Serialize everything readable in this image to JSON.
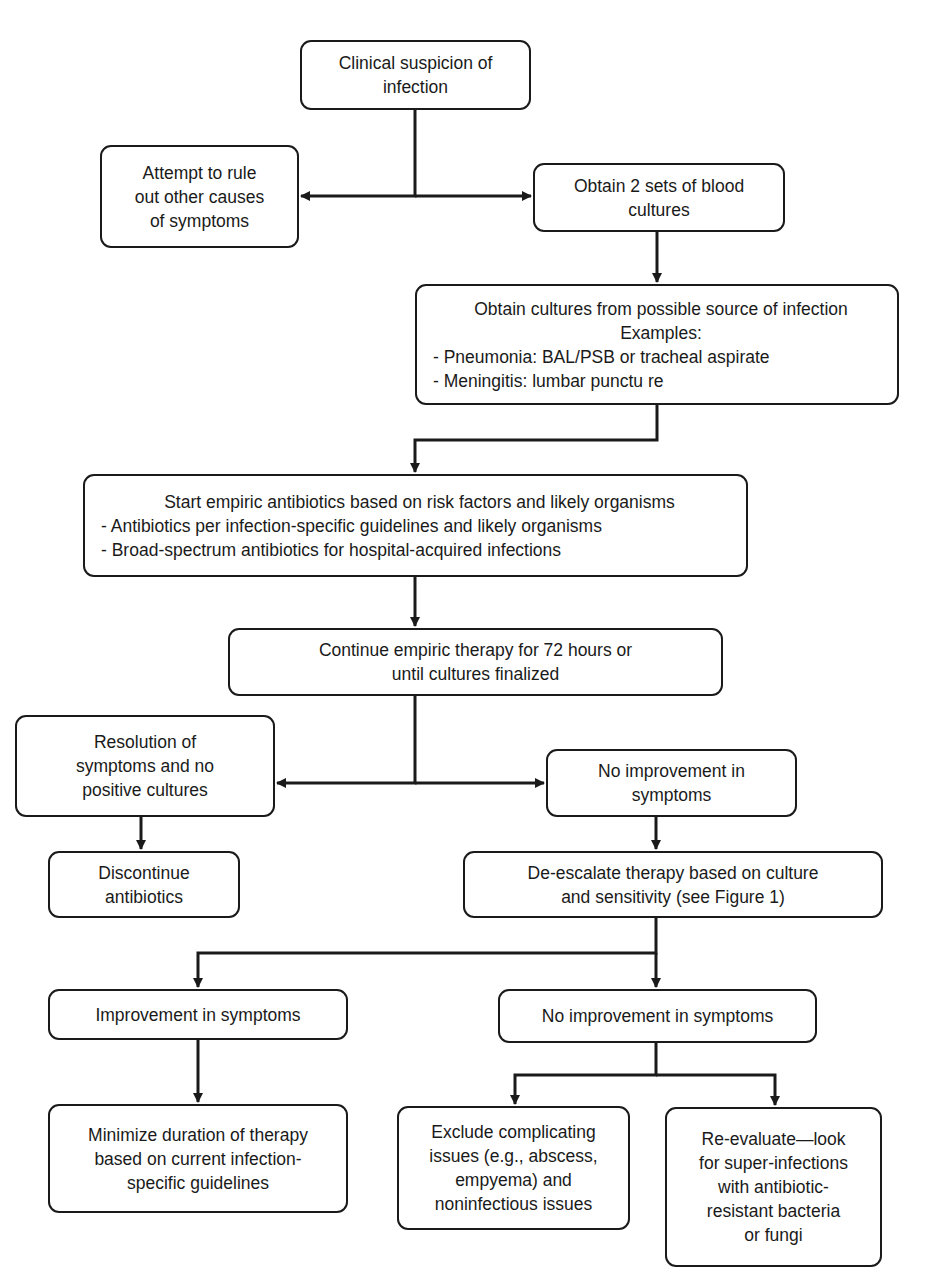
{
  "diagram": {
    "type": "flowchart",
    "nodes": {
      "clinical_suspicion": {
        "lines": [
          "Clinical suspicion of",
          "infection"
        ]
      },
      "rule_out_other": {
        "lines": [
          "Attempt to rule",
          "out other causes",
          "of symptoms"
        ]
      },
      "blood_cultures": {
        "lines": [
          "Obtain 2 sets of blood",
          "cultures"
        ]
      },
      "source_cultures": {
        "lines": [
          "Obtain cultures from possible source of infection",
          "Examples:"
        ],
        "bullets": [
          "-  Pneumonia: BAL/PSB or tracheal aspirate",
          "-  Meningitis: lumbar punctu re"
        ]
      },
      "start_empiric": {
        "lines": [
          "Start empiric antibiotics based on risk factors and likely organisms"
        ],
        "bullets": [
          "-  Antibiotics per infection-specific guidelines and likely organisms",
          "-  Broad-spectrum antibiotics for hospital-acquired infections"
        ]
      },
      "continue_empiric": {
        "lines": [
          "Continue empiric therapy for 72 hours or",
          "until cultures finalized"
        ]
      },
      "resolution": {
        "lines": [
          "Resolution of",
          "symptoms and no",
          "positive cultures"
        ]
      },
      "no_improvement_1": {
        "lines": [
          "No improvement in",
          "symptoms"
        ]
      },
      "discontinue": {
        "lines": [
          "Discontinue",
          "antibiotics"
        ]
      },
      "de_escalate": {
        "lines": [
          "De-escalate therapy based on culture",
          "and sensitivity (see Figure 1)"
        ]
      },
      "improvement": {
        "lines": [
          "Improvement in symptoms"
        ]
      },
      "no_improvement_2": {
        "lines": [
          "No improvement in symptoms"
        ]
      },
      "minimize_duration": {
        "lines": [
          "Minimize duration of therapy",
          "based on current infection-",
          "specific guidelines"
        ]
      },
      "exclude_complicating": {
        "lines": [
          "Exclude complicating",
          "issues (e.g., abscess,",
          "empyema) and",
          "noninfectious issues"
        ]
      },
      "re_evaluate": {
        "lines": [
          "Re-evaluate—look",
          "for super-infections",
          "with antibiotic-",
          "resistant bacteria",
          "or fungi"
        ]
      }
    },
    "edges": [
      {
        "from": "clinical_suspicion",
        "to": "rule_out_other"
      },
      {
        "from": "clinical_suspicion",
        "to": "blood_cultures"
      },
      {
        "from": "blood_cultures",
        "to": "source_cultures"
      },
      {
        "from": "source_cultures",
        "to": "start_empiric"
      },
      {
        "from": "start_empiric",
        "to": "continue_empiric"
      },
      {
        "from": "continue_empiric",
        "to": "resolution"
      },
      {
        "from": "continue_empiric",
        "to": "no_improvement_1"
      },
      {
        "from": "resolution",
        "to": "discontinue"
      },
      {
        "from": "no_improvement_1",
        "to": "de_escalate"
      },
      {
        "from": "de_escalate",
        "to": "improvement"
      },
      {
        "from": "de_escalate",
        "to": "no_improvement_2"
      },
      {
        "from": "improvement",
        "to": "minimize_duration"
      },
      {
        "from": "no_improvement_2",
        "to": "exclude_complicating"
      },
      {
        "from": "no_improvement_2",
        "to": "re_evaluate"
      }
    ],
    "colors": {
      "stroke": "#1a1a1a",
      "fill": "#ffffff",
      "text": "#1a1a1a"
    }
  }
}
